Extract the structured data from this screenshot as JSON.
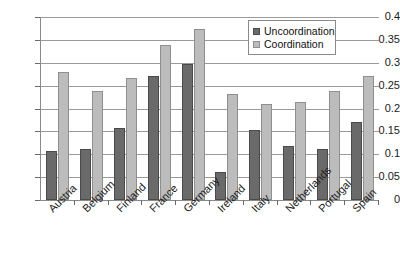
{
  "chart_data": {
    "type": "bar",
    "title": "",
    "subtitle": "",
    "xlabel": "",
    "ylabel": "",
    "ylim": [
      0,
      0.4
    ],
    "ytick_values": [
      0,
      0.05,
      0.1,
      0.15,
      0.2,
      0.25,
      0.3,
      0.35,
      0.4
    ],
    "ytick_labels": [
      "0",
      "0.05",
      "0.1",
      "0.15",
      "0.2",
      "0.25",
      "0.3",
      "0.35",
      "0.4"
    ],
    "grid": true,
    "grid_axis": "y",
    "legend_position": "top-right",
    "categories": [
      "Austria",
      "Belgium",
      "Finland",
      "France",
      "Germany",
      "Ireland",
      "Italy",
      "Netherlands",
      "Portugal",
      "Spain"
    ],
    "series": [
      {
        "name": "Uncoordination",
        "color": "#6a6a6a",
        "values": [
          0.107,
          0.112,
          0.158,
          0.272,
          0.297,
          0.061,
          0.153,
          0.119,
          0.112,
          0.17
        ]
      },
      {
        "name": "Coordination",
        "color": "#bcbcbc",
        "values": [
          0.28,
          0.239,
          0.267,
          0.338,
          0.374,
          0.232,
          0.209,
          0.215,
          0.238,
          0.271
        ]
      }
    ]
  },
  "legend": {
    "items": [
      {
        "label": "Uncoordination",
        "swatch": "uncoordination"
      },
      {
        "label": "Coordination",
        "swatch": "coordination"
      }
    ]
  }
}
